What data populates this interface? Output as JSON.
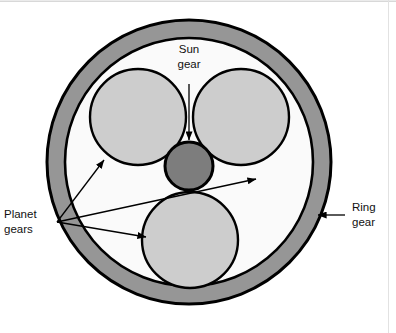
{
  "figure": {
    "type": "diagram",
    "canvas": {
      "width": 396,
      "height": 333,
      "background": "#ffffff"
    }
  },
  "colors": {
    "ring_fill": "#969696",
    "sun_fill": "#7d7d7d",
    "planet_fill": "#cdcdcd",
    "interior_fill": "#fafafa",
    "outline": "#000000",
    "text": "#111111",
    "frame": "#e0e0e0"
  },
  "labels": {
    "sun": {
      "line1": "Sun",
      "line2": "gear"
    },
    "planet": {
      "line1": "Planet",
      "line2": "gears"
    },
    "ring": {
      "line1": "Ring",
      "line2": "gear"
    }
  },
  "geometry": {
    "ring_gear": {
      "cx": 189,
      "cy": 162,
      "outer_r": 142,
      "inner_r": 124
    },
    "sun_gear": {
      "cx": 189,
      "cy": 166,
      "r": 24
    },
    "planet_gears": [
      {
        "name": "upper-left",
        "cx": 138,
        "cy": 117,
        "r": 48
      },
      {
        "name": "upper-right",
        "cx": 241,
        "cy": 117,
        "r": 48
      },
      {
        "name": "bottom",
        "cx": 190,
        "cy": 240,
        "r": 48
      }
    ]
  },
  "annotations": {
    "sun_leader": {
      "from_x": 189,
      "from_y": 84,
      "to_x": 189,
      "to_y": 140
    },
    "ring_leader": {
      "from_x": 345,
      "from_y": 215,
      "to_x": 316,
      "to_y": 215
    },
    "planet_origin": {
      "x": 57,
      "y": 222
    },
    "planet_leaders": [
      {
        "to_x": 105,
        "to_y": 161
      },
      {
        "to_x": 255,
        "to_y": 178
      },
      {
        "to_x": 145,
        "to_y": 237
      }
    ]
  }
}
